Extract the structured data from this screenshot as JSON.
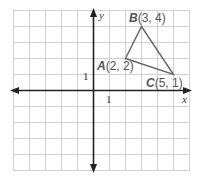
{
  "axes": {
    "x_label": "x",
    "y_label": "y",
    "x_tick": "1",
    "y_tick": "1"
  },
  "grid": {
    "x_min": -5,
    "x_max": 6,
    "y_min": -5,
    "y_max": 5
  },
  "points": [
    {
      "name": "A",
      "coords": "(2, 2)",
      "x": 2,
      "y": 2
    },
    {
      "name": "B",
      "coords": "(3, 4)",
      "x": 3,
      "y": 4
    },
    {
      "name": "C",
      "coords": "(5, 1)",
      "x": 5,
      "y": 1
    }
  ],
  "colors": {
    "grid": "#d0d0d0",
    "axis": "#222222",
    "triangle": "#666666"
  }
}
